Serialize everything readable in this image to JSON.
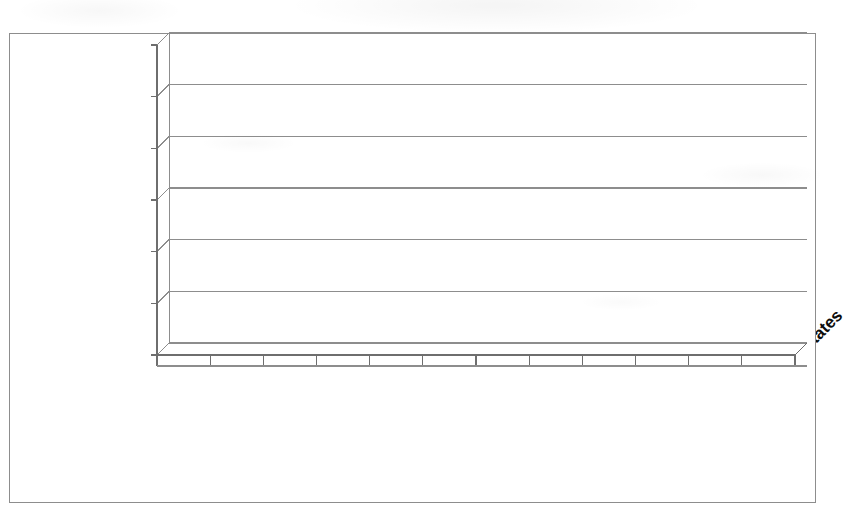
{
  "chart_data": {
    "type": "bar",
    "title": "",
    "subtitle": "",
    "xlabel": "",
    "ylabel": "",
    "categories": [
      "Australia",
      "France",
      "Turkey",
      "Canada",
      "China",
      "Germany",
      "United Kingdom",
      "Spain",
      "Italy",
      "Brazil",
      "India",
      "United States"
    ],
    "values": [
      50000,
      55000,
      62000,
      75000,
      135000,
      148000,
      158000,
      148000,
      200000,
      610000,
      1020000,
      1170000
    ],
    "series": [
      {
        "name": "",
        "values": [
          50000,
          55000,
          62000,
          75000,
          135000,
          148000,
          158000,
          148000,
          200000,
          610000,
          1020000,
          1170000
        ]
      }
    ],
    "ylim": [
      0,
      1200000
    ],
    "ytick_values": [
      0,
      200000,
      400000,
      600000,
      800000,
      1000000,
      1200000
    ],
    "ytick_labels": [
      "0",
      "200,000",
      "400,000",
      "600,000",
      "800,000",
      "1,000,000",
      "1,200,000"
    ],
    "grid": true,
    "grid_axis": "y",
    "legend": false,
    "legend_position": "none",
    "annotations": [],
    "style": "3d-column",
    "bar_color": "#4f4f4f",
    "bar_top_color": "#5e5e5e",
    "bar_side_color": "#3b3b3b",
    "bar_edge_color": "#2e2e2e",
    "gridline_color": "#8d8d8d",
    "plot_background": "#ffffff",
    "frame_color": "#8d8d8d",
    "text_color": "#0c0c0c"
  },
  "axis": {
    "y_ticks": [
      {
        "label": "1,200,000",
        "value": 1200000
      },
      {
        "label": "1,000,000",
        "value": 1000000
      },
      {
        "label": "800,000",
        "value": 800000
      },
      {
        "label": "600,000",
        "value": 600000
      },
      {
        "label": "400,000",
        "value": 400000
      },
      {
        "label": "200,000",
        "value": 200000
      },
      {
        "label": "0",
        "value": 0
      }
    ]
  },
  "bars": [
    {
      "label": "Australia",
      "value": 50000
    },
    {
      "label": "France",
      "value": 55000
    },
    {
      "label": "Turkey",
      "value": 62000
    },
    {
      "label": "Canada",
      "value": 75000
    },
    {
      "label": "China",
      "value": 135000
    },
    {
      "label": "Germany",
      "value": 148000
    },
    {
      "label": "United Kingdom",
      "value": 158000
    },
    {
      "label": "Spain",
      "value": 148000
    },
    {
      "label": "Italy",
      "value": 200000
    },
    {
      "label": "Brazil",
      "value": 610000
    },
    {
      "label": "India",
      "value": 1020000
    },
    {
      "label": "United States",
      "value": 1170000
    }
  ]
}
